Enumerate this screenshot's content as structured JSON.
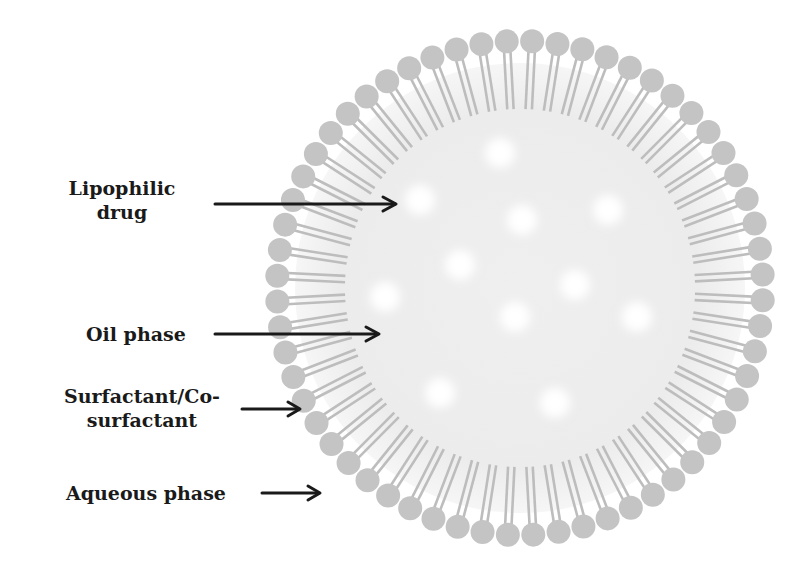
{
  "diagram": {
    "labels": [
      {
        "id": "lipophilic-drug",
        "line1": "Lipophilic",
        "line2": "drug"
      },
      {
        "id": "oil-phase",
        "line1": "Oil phase"
      },
      {
        "id": "surfactant",
        "line1": "Surfactant/Co-",
        "line2": "surfactant"
      },
      {
        "id": "aqueous-phase",
        "line1": "Aqueous phase"
      }
    ],
    "colors": {
      "core": "#ededed",
      "surfactant_head": "#c4c4c4",
      "surfactant_tail": "#bdbdbd",
      "drug_droplet": "#ffffff",
      "arrow": "#1a1a1a",
      "text": "#1a1a1a"
    },
    "geometry": {
      "center": [
        520,
        288
      ],
      "head_radius_ring": 245,
      "head_size": 12,
      "core_radius": 190,
      "surfactant_count": 60,
      "drug_droplets": [
        [
          500,
          153
        ],
        [
          420,
          200
        ],
        [
          608,
          210
        ],
        [
          522,
          220
        ],
        [
          460,
          265
        ],
        [
          575,
          285
        ],
        [
          385,
          297
        ],
        [
          515,
          317
        ],
        [
          637,
          317
        ],
        [
          440,
          393
        ],
        [
          555,
          403
        ]
      ]
    }
  }
}
